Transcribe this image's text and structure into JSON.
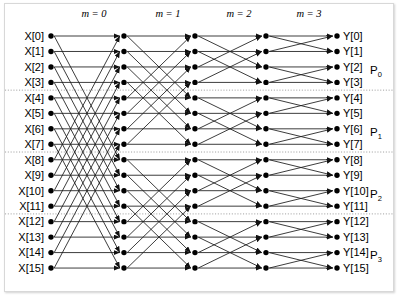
{
  "figure": {
    "background_color": "#ffffff",
    "line_color": "#1a1a1a",
    "node_color": "#000000",
    "separator_color": "#8c8c8c"
  },
  "stage_labels": [
    {
      "text": "m = 0",
      "x": 94,
      "y": 17
    },
    {
      "text": "m = 1",
      "x": 168,
      "y": 17
    },
    {
      "text": "m = 2",
      "x": 239,
      "y": 17
    },
    {
      "text": "m = 3",
      "x": 309,
      "y": 17
    }
  ],
  "input_labels": [
    "X[0]",
    "X[1]",
    "X[2]",
    "X[3]",
    "X[4]",
    "X[5]",
    "X[6]",
    "X[7]",
    "X[8]",
    "X[9]",
    "X[10]",
    "X[11]",
    "X[12]",
    "X[13]",
    "X[14]",
    "X[15]"
  ],
  "output_labels": [
    "Y[0]",
    "Y[1]",
    "Y[2]",
    "Y[3]",
    "Y[4]",
    "Y[5]",
    "Y[6]",
    "Y[7]",
    "Y[8]",
    "Y[9]",
    "Y[10]",
    "Y[11]",
    "Y[12]",
    "Y[13]",
    "Y[14]",
    "Y[15]"
  ],
  "partition_labels": [
    {
      "base": "P",
      "sub": "0",
      "x": 370,
      "y": 74
    },
    {
      "base": "P",
      "sub": "1",
      "x": 370,
      "y": 136
    },
    {
      "base": "P",
      "sub": "2",
      "x": 370,
      "y": 198
    },
    {
      "base": "P",
      "sub": "3",
      "x": 370,
      "y": 259
    }
  ],
  "chart_data": {
    "type": "diagram",
    "n_points": 16,
    "n_stages": 4,
    "stage_names": [
      "m = 0",
      "m = 1",
      "m = 2",
      "m = 3"
    ],
    "stage_butterfly_distance": [
      8,
      4,
      2,
      1
    ],
    "node_column_x": [
      51,
      124,
      195,
      266,
      337
    ],
    "row_y_start": 36,
    "row_spacing": 15.47,
    "partitions": [
      "P0",
      "P1",
      "P2",
      "P3"
    ],
    "partition_row_ranges": [
      [
        0,
        3
      ],
      [
        4,
        7
      ],
      [
        8,
        11
      ],
      [
        12,
        15
      ]
    ],
    "separator_rows_after": [
      3,
      7,
      11
    ],
    "xlabel": "",
    "ylabel": "",
    "grid": false,
    "legend": "none"
  }
}
